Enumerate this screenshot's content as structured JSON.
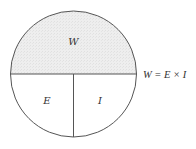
{
  "diagram": {
    "type": "power-formula-circle",
    "colors": {
      "stroke": "#555555",
      "top_fill": "#ebebeb",
      "bottom_fill": "#ffffff",
      "text": "#333333"
    },
    "sections": {
      "top": {
        "label": "W"
      },
      "bottom_left": {
        "label": "E"
      },
      "bottom_right": {
        "label": "I"
      }
    },
    "formula": "W = E × I"
  }
}
